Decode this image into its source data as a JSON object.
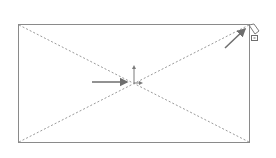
{
  "drawing": {
    "type": "cad-sketch",
    "shape": "rectangle",
    "construction_lines": "diagonals",
    "colors": {
      "outline": "#8a8a8a",
      "construction": "#9a9a9a",
      "arrow": "#6e6e6e",
      "origin": "#7a7a7a",
      "background": "#ffffff"
    },
    "annotations": [
      {
        "name": "origin-pointer-arrow",
        "target": "sketch-origin"
      },
      {
        "name": "corner-pointer-arrow",
        "target": "rectangle-top-right-corner"
      }
    ],
    "icons": [
      "sketch-origin-icon",
      "pencil-cursor-icon",
      "coincident-relation-icon"
    ]
  }
}
